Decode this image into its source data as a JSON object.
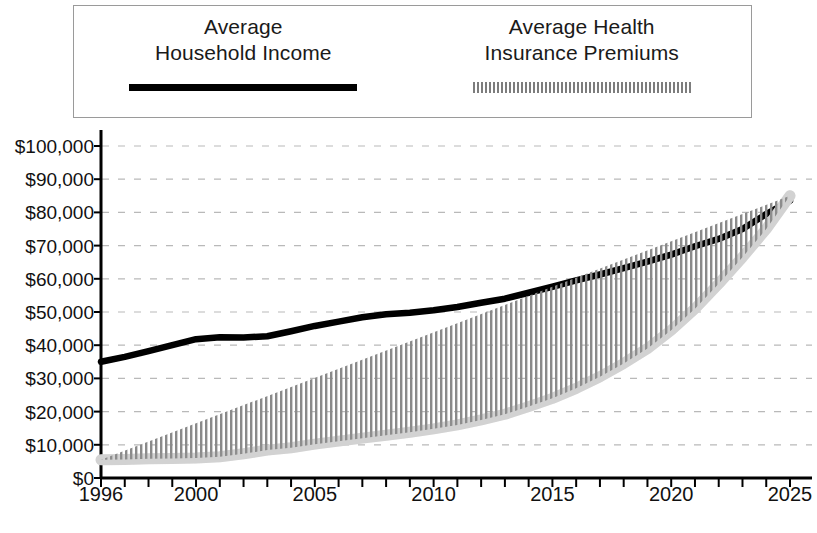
{
  "legend": {
    "border_color": "#9a9a9a",
    "entries": [
      {
        "label": "Average\nHousehold Income",
        "swatch": "solid-black-line",
        "color": "#000000"
      },
      {
        "label": "Average Health\nInsurance Premiums",
        "swatch": "gray-hatched-line",
        "color": "#7d7d7d"
      }
    ]
  },
  "axes": {
    "y_tick_labels": [
      "$100,000",
      "$90,000",
      "$80,000",
      "$70,000",
      "$60,000",
      "$50,000",
      "$40,000",
      "$30,000",
      "$20,000",
      "$10,000",
      "$0"
    ],
    "x_tick_labels": [
      "1996",
      "2000",
      "2005",
      "2010",
      "2015",
      "2020",
      "2025"
    ]
  },
  "chart_data": {
    "type": "line",
    "title": "",
    "subtitle": "",
    "xlabel": "",
    "ylabel": "",
    "xlim": [
      1996,
      2025
    ],
    "ylim": [
      0,
      100000
    ],
    "y_tick_step": 10000,
    "x_minor_tick_step": 1,
    "grid": "horizontal-dashed",
    "legend_position": "top",
    "x": [
      1996,
      1997,
      1998,
      1999,
      2000,
      2001,
      2002,
      2003,
      2004,
      2005,
      2006,
      2007,
      2008,
      2009,
      2010,
      2011,
      2012,
      2013,
      2014,
      2015,
      2016,
      2017,
      2018,
      2019,
      2020,
      2021,
      2022,
      2023,
      2024,
      2025
    ],
    "series": [
      {
        "name": "Average Household Income",
        "color": "#000000",
        "style": "solid",
        "values": [
          35000,
          36500,
          38200,
          40000,
          41800,
          42400,
          42300,
          42700,
          44200,
          45800,
          47100,
          48400,
          49300,
          49800,
          50500,
          51500,
          52800,
          54000,
          55800,
          57600,
          59500,
          61300,
          63200,
          65200,
          67300,
          69800,
          72000,
          75000,
          79500,
          83500
        ]
      },
      {
        "name": "Average Health Insurance Premiums",
        "color": "#7d7d7d",
        "style": "hatched",
        "values": [
          5500,
          5600,
          5800,
          5900,
          6000,
          6400,
          7300,
          8400,
          9100,
          10200,
          11100,
          12000,
          12900,
          13800,
          14800,
          16000,
          17500,
          19200,
          21500,
          24000,
          27000,
          30500,
          34500,
          39000,
          44500,
          51000,
          58500,
          66500,
          75000,
          85000
        ]
      }
    ],
    "annotations": [
      "Premiums curve crosses above the household income curve at 2025"
    ]
  }
}
